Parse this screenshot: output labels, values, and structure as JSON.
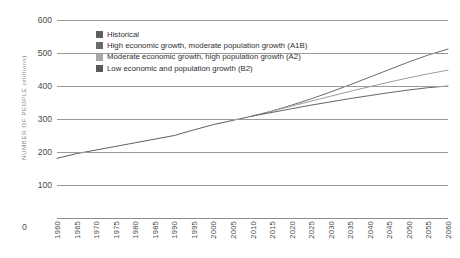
{
  "chart_data": {
    "type": "line",
    "title": "",
    "xlabel": "",
    "ylabel": "NUMBER OF PEOPLE (millions)",
    "ylim": [
      0,
      600
    ],
    "ytick_labels": [
      "600",
      "500",
      "400",
      "300",
      "200",
      "100",
      "0"
    ],
    "ytick_values": [
      600,
      500,
      400,
      300,
      200,
      100,
      0
    ],
    "xlim": [
      1960,
      2060
    ],
    "grid": true,
    "legend_position": "top-center",
    "zero_label": "0",
    "categories": [
      "1960",
      "1965",
      "1970",
      "1975",
      "1980",
      "1985",
      "1990",
      "1995",
      "2000",
      "2005",
      "2010",
      "2015",
      "2020",
      "2025",
      "2030",
      "2035",
      "2040",
      "2045",
      "2050",
      "2055",
      "2060"
    ],
    "series": [
      {
        "name": "Historical",
        "color": "#5f5f5f",
        "x": [
          1960,
          1965,
          1970,
          1975,
          1980,
          1985,
          1990,
          1995,
          2000,
          2005,
          2010
        ],
        "values": [
          181,
          195,
          206,
          217,
          228,
          239,
          250,
          267,
          283,
          296,
          309
        ]
      },
      {
        "name": "High economic growth, moderate population growth (A1B)",
        "color": "#6b6b6b",
        "x": [
          2010,
          2015,
          2020,
          2025,
          2030,
          2035,
          2040,
          2045,
          2050,
          2055,
          2060
        ],
        "values": [
          309,
          324,
          342,
          361,
          382,
          404,
          427,
          450,
          473,
          494,
          512
        ]
      },
      {
        "name": "Moderate economic growth, high population growth (A2)",
        "color": "#9c9c9c",
        "x": [
          2010,
          2015,
          2020,
          2025,
          2030,
          2035,
          2040,
          2045,
          2050,
          2055,
          2060
        ],
        "values": [
          309,
          324,
          339,
          354,
          369,
          384,
          398,
          412,
          425,
          437,
          448
        ]
      },
      {
        "name": "Low economic and population growth (B2)",
        "color": "#646464",
        "x": [
          2010,
          2015,
          2020,
          2025,
          2030,
          2035,
          2040,
          2045,
          2050,
          2055,
          2060
        ],
        "values": [
          309,
          320,
          331,
          342,
          352,
          362,
          371,
          380,
          388,
          395,
          400
        ]
      }
    ]
  },
  "legend": {
    "items": [
      {
        "label": "Historical",
        "swatch": "#5f5f5f"
      },
      {
        "label": "High economic growth, moderate population growth (A1B)",
        "swatch": "#6b6b6b"
      },
      {
        "label": "Moderate economic growth, high population growth (A2)",
        "swatch": "#a8a8a8"
      },
      {
        "label": "Low economic and population growth (B2)",
        "swatch": "#595959"
      }
    ]
  }
}
